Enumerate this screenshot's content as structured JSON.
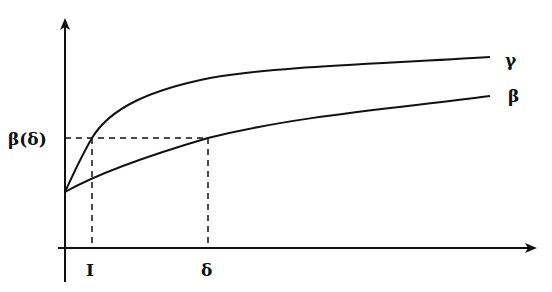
{
  "diagram": {
    "axes": {
      "x_axis": "horizontal axis with arrow",
      "y_axis": "vertical axis with arrow"
    },
    "curves": [
      {
        "name": "gamma",
        "label": "γ"
      },
      {
        "name": "beta",
        "label": "β"
      }
    ],
    "y_marker_label": "β(δ)",
    "x_markers": [
      {
        "name": "I",
        "label": "I"
      },
      {
        "name": "delta",
        "label": "δ"
      }
    ],
    "colors": {
      "stroke": "#111111",
      "background": "#ffffff"
    }
  }
}
